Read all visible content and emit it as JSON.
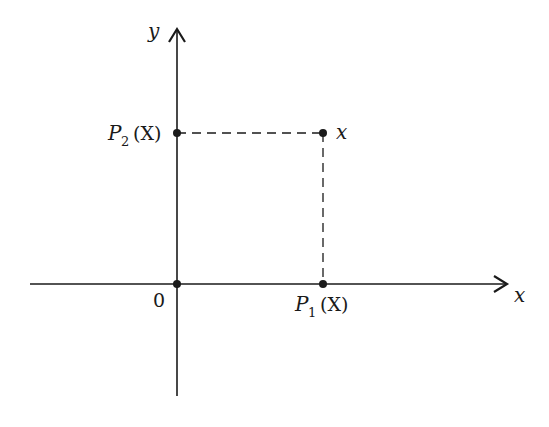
{
  "diagram": {
    "type": "coordinate-projection",
    "axes": {
      "x_label": "x",
      "y_label": "y",
      "origin_label": "0"
    },
    "points": {
      "point_x": {
        "label": "x"
      },
      "p1": {
        "label_main": "P",
        "label_sub": "1",
        "label_arg": "(X)"
      },
      "p2": {
        "label_main": "P",
        "label_sub": "2",
        "label_arg": "(X)"
      }
    },
    "colors": {
      "ink": "#1a1a1a",
      "background": "#ffffff"
    }
  }
}
